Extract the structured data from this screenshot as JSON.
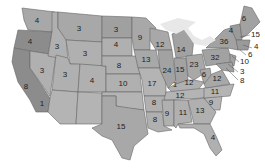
{
  "map": {
    "title": "",
    "colors": {
      "light": "#b4b4b4",
      "mid": "#a2a2a2",
      "dark": "#8c8c8c",
      "lakes": "#e8e8e8",
      "border": "#666666"
    },
    "states": [
      {
        "name": "Washington",
        "value": "4",
        "x": 37,
        "y": 21
      },
      {
        "name": "Oregon",
        "value": "4",
        "x": 30,
        "y": 42
      },
      {
        "name": "California",
        "value": "8",
        "x": 26,
        "y": 87
      },
      {
        "name": "California-south",
        "value": "1",
        "x": 42,
        "y": 104
      },
      {
        "name": "Idaho",
        "value": "3",
        "x": 57,
        "y": 47
      },
      {
        "name": "Nevada",
        "value": "3",
        "x": 42,
        "y": 71
      },
      {
        "name": "Montana",
        "value": "3",
        "x": 79,
        "y": 29
      },
      {
        "name": "Wyoming",
        "value": "3",
        "x": 85,
        "y": 54
      },
      {
        "name": "Utah",
        "value": "3",
        "x": 65,
        "y": 75
      },
      {
        "name": "Colorado",
        "value": "4",
        "x": 92,
        "y": 81
      },
      {
        "name": "North Dakota",
        "value": "3",
        "x": 116,
        "y": 30
      },
      {
        "name": "South Dakota",
        "value": "4",
        "x": 116,
        "y": 45
      },
      {
        "name": "Nebraska",
        "value": "8",
        "x": 119,
        "y": 66
      },
      {
        "name": "Kansas",
        "value": "10",
        "x": 123,
        "y": 84
      },
      {
        "name": "Minnesota",
        "value": "9",
        "x": 140,
        "y": 38
      },
      {
        "name": "Iowa",
        "value": "13",
        "x": 146,
        "y": 60
      },
      {
        "name": "Missouri",
        "value": "17",
        "x": 152,
        "y": 84
      },
      {
        "name": "Wisconsin",
        "value": "12",
        "x": 160,
        "y": 45
      },
      {
        "name": "Michigan",
        "value": "14",
        "x": 181,
        "y": 50
      },
      {
        "name": "Illinois",
        "value": "24",
        "x": 167,
        "y": 71
      },
      {
        "name": "Indiana",
        "value": "15",
        "x": 180,
        "y": 70
      },
      {
        "name": "Ohio",
        "value": "23",
        "x": 194,
        "y": 65
      },
      {
        "name": "Kentucky-west",
        "value": "1",
        "x": 175,
        "y": 85
      },
      {
        "name": "Kentucky",
        "value": "12",
        "x": 189,
        "y": 83
      },
      {
        "name": "West Virginia",
        "value": "6",
        "x": 204,
        "y": 75
      },
      {
        "name": "Virginia",
        "value": "12",
        "x": 217,
        "y": 79
      },
      {
        "name": "Pennsylvania",
        "value": "32",
        "x": 215,
        "y": 58
      },
      {
        "name": "New York",
        "value": "36",
        "x": 224,
        "y": 42
      },
      {
        "name": "Vermont",
        "value": "4",
        "x": 231,
        "y": 31
      },
      {
        "name": "Maine",
        "value": "6",
        "x": 244,
        "y": 19
      },
      {
        "name": "Tennessee",
        "value": "12",
        "x": 180,
        "y": 96
      },
      {
        "name": "North Carolina",
        "value": "11",
        "x": 215,
        "y": 92
      },
      {
        "name": "South Carolina",
        "value": "9",
        "x": 211,
        "y": 103
      },
      {
        "name": "Georgia",
        "value": "13",
        "x": 200,
        "y": 111
      },
      {
        "name": "Alabama",
        "value": "11",
        "x": 183,
        "y": 113
      },
      {
        "name": "Mississippi",
        "value": "9",
        "x": 167,
        "y": 114
      },
      {
        "name": "Arkansas",
        "value": "8",
        "x": 154,
        "y": 103
      },
      {
        "name": "Louisiana",
        "value": "8",
        "x": 155,
        "y": 120
      },
      {
        "name": "Texas",
        "value": "15",
        "x": 121,
        "y": 127
      },
      {
        "name": "Florida",
        "value": "4",
        "x": 213,
        "y": 138
      }
    ],
    "callouts": [
      {
        "name": "New Hampshire",
        "value": "15",
        "x": 251,
        "y": 35
      },
      {
        "name": "Massachusetts",
        "value": "4",
        "x": 254,
        "y": 47
      },
      {
        "name": "Rhode Island",
        "value": "6",
        "x": 248,
        "y": 55
      },
      {
        "name": "Connecticut",
        "value": "10",
        "x": 240,
        "y": 62
      },
      {
        "name": "New Jersey",
        "value": "3",
        "x": 240,
        "y": 72
      },
      {
        "name": "Delaware/Maryland",
        "value": "8",
        "x": 240,
        "y": 81
      }
    ]
  }
}
